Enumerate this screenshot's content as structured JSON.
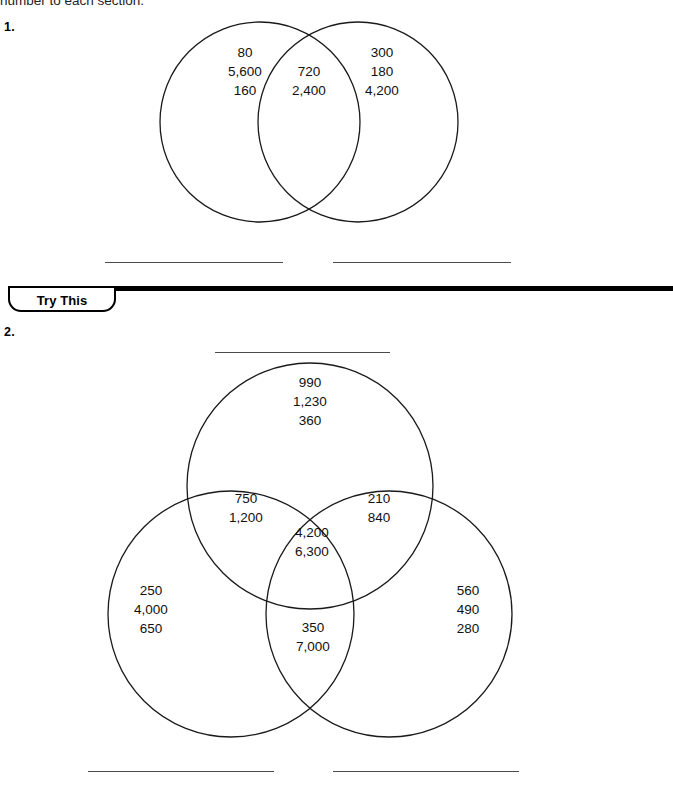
{
  "page": {
    "instruction_text": "number to each section.",
    "banner_label": "Try This"
  },
  "problems": [
    {
      "number": "1.",
      "type": "two-circle-venn",
      "regions": {
        "left_only": [
          "80",
          "5,600",
          "160"
        ],
        "intersection": [
          "720",
          "2,400"
        ],
        "right_only": [
          "300",
          "180",
          "4,200"
        ]
      },
      "answer_lines": 2
    },
    {
      "number": "2.",
      "type": "three-circle-venn",
      "regions": {
        "top_only": [
          "990",
          "1,230",
          "360"
        ],
        "top_left_overlap": [
          "750",
          "1,200"
        ],
        "top_right_overlap": [
          "210",
          "840"
        ],
        "center_all": [
          "4,200",
          "6,300"
        ],
        "left_only": [
          "250",
          "4,000",
          "650"
        ],
        "bottom_overlap": [
          "350",
          "7,000"
        ],
        "right_only": [
          "560",
          "490",
          "280"
        ]
      },
      "answer_lines_above": 1,
      "answer_lines_below": 2
    }
  ],
  "colors": {
    "stroke": "#1a1a1a",
    "text": "#111111",
    "rule": "#000000",
    "blank_line": "#4a4a4a"
  }
}
